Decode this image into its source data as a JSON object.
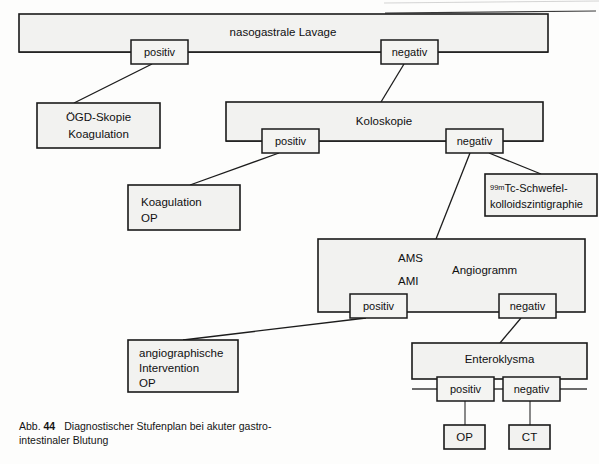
{
  "figure": {
    "caption_label": "Abb.",
    "caption_number": "44",
    "caption_text_line1": "Diagnostischer Stufenplan bei akuter gastro-",
    "caption_text_line2": "intestinaler Blutung",
    "language": "de"
  },
  "colors": {
    "box_fill": "#f2f2f0",
    "box_stroke": "#1a1a1a",
    "connector": "#1c1c1c",
    "page_background": "#ffffff",
    "text": "#101010"
  },
  "nodes": {
    "nasogastrale_lavage": {
      "label": "nasogastrale Lavage",
      "x": 19,
      "y": 14,
      "w": 529,
      "h": 36
    },
    "lavage_positiv": {
      "label": "positiv",
      "x": 131,
      "y": 40,
      "w": 57,
      "h": 24
    },
    "lavage_negativ": {
      "label": "negativ",
      "x": 381,
      "y": 40,
      "w": 57,
      "h": 24
    },
    "oegd_skopie": {
      "label_line1": "ÖGD-Skopie",
      "label_line2": "Koagulation",
      "x": 37,
      "y": 103,
      "w": 123,
      "h": 45
    },
    "koloskopie": {
      "label": "Koloskopie",
      "x": 226,
      "y": 102,
      "w": 317,
      "h": 36
    },
    "kolo_positiv": {
      "label": "positiv",
      "x": 262,
      "y": 129,
      "w": 57,
      "h": 24
    },
    "kolo_negativ": {
      "label": "negativ",
      "x": 446,
      "y": 129,
      "w": 57,
      "h": 24
    },
    "koagulation_op": {
      "label_line1": "Koagulation",
      "label_line2": "OP",
      "x": 128,
      "y": 185,
      "w": 112,
      "h": 45
    },
    "tc_szintigraphie": {
      "superscript": "99m",
      "label_line1": "Tc-Schwefel-",
      "label_line2": "kolloidszintigraphie",
      "x": 485,
      "y": 174,
      "w": 112,
      "h": 42
    },
    "angiogramm": {
      "label": "Angiogramm",
      "label_ams": "AMS",
      "label_ami": "AMI",
      "x": 318,
      "y": 239,
      "w": 267,
      "h": 73
    },
    "angio_positiv": {
      "label": "positiv",
      "x": 350,
      "y": 294,
      "w": 57,
      "h": 24
    },
    "angio_negativ": {
      "label": "negativ",
      "x": 499,
      "y": 294,
      "w": 57,
      "h": 24
    },
    "angiographische_intervention": {
      "label_line1": "angiographische",
      "label_line2": "Intervention",
      "label_line3": "OP",
      "x": 128,
      "y": 340,
      "w": 110,
      "h": 52
    },
    "enteroklysma": {
      "label": "Enteroklysma",
      "x": 412,
      "y": 343,
      "w": 175,
      "h": 34
    },
    "entero_positiv": {
      "label": "positiv",
      "x": 437,
      "y": 377,
      "w": 57,
      "h": 24
    },
    "entero_negativ": {
      "label": "negativ",
      "x": 503,
      "y": 377,
      "w": 57,
      "h": 24
    },
    "op_final": {
      "label": "OP",
      "x": 444,
      "y": 425,
      "w": 41,
      "h": 24
    },
    "ct_final": {
      "label": "CT",
      "x": 509,
      "y": 425,
      "w": 41,
      "h": 24
    }
  },
  "edges": [
    {
      "name": "lavage-positiv-to-oegd",
      "from": "lavage_positiv",
      "to": "oegd_skopie"
    },
    {
      "name": "lavage-negativ-to-koloskopie",
      "from": "lavage_negativ",
      "to": "koloskopie"
    },
    {
      "name": "kolo-positiv-to-koagulation-op",
      "from": "kolo_positiv",
      "to": "koagulation_op"
    },
    {
      "name": "kolo-negativ-to-tc",
      "from": "kolo_negativ",
      "to": "tc_szintigraphie"
    },
    {
      "name": "kolo-negativ-to-angiogramm",
      "from": "kolo_negativ",
      "to": "angiogramm"
    },
    {
      "name": "angio-positiv-to-intervention",
      "from": "angio_positiv",
      "to": "angiographische_intervention"
    },
    {
      "name": "angio-negativ-to-enteroklysma",
      "from": "angio_negativ",
      "to": "enteroklysma"
    },
    {
      "name": "entero-positiv-to-op",
      "from": "entero_positiv",
      "to": "op_final"
    },
    {
      "name": "entero-negativ-to-ct",
      "from": "entero_negativ",
      "to": "ct_final"
    }
  ]
}
